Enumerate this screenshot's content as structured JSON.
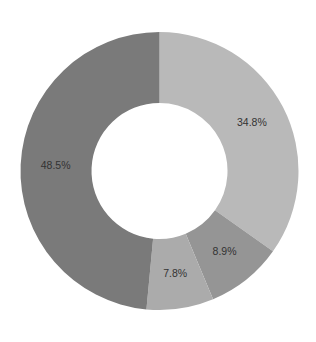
{
  "chart_data": {
    "type": "pie",
    "subtype": "donut",
    "title": "",
    "start_angle_deg": 0,
    "direction": "clockwise",
    "inner_radius_ratio": 0.49,
    "slices": [
      {
        "label": "34.8%",
        "value": 34.8,
        "color": "#b9b9b9"
      },
      {
        "label": "8.9%",
        "value": 8.9,
        "color": "#959595"
      },
      {
        "label": "7.8%",
        "value": 7.8,
        "color": "#ababab"
      },
      {
        "label": "48.5%",
        "value": 48.5,
        "color": "#7a7a7a"
      }
    ],
    "legend": "none",
    "grid": false
  },
  "layout": {
    "cx": 159.5,
    "cy": 171,
    "outer_r": 139,
    "inner_r": 68,
    "label_r": 104
  }
}
